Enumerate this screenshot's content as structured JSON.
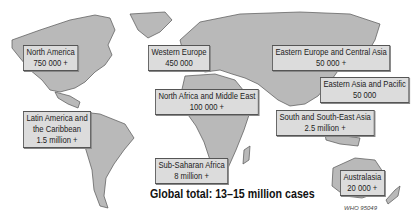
{
  "map": {
    "regions": [
      {
        "name": "North America",
        "value": "750 000 +"
      },
      {
        "name": "Western Europe",
        "value": "450 000"
      },
      {
        "name": "Eastern Europe and Central Asia",
        "value": "50 000 +"
      },
      {
        "name": "Eastern Asia and Pacific",
        "value": "50 000"
      },
      {
        "name": "North Africa and Middle East",
        "value": "100 000 +"
      },
      {
        "name": "Latin America and the Caribbean",
        "name_line1": "Latin America and",
        "name_line2": "the Caribbean",
        "value": "1.5 million +"
      },
      {
        "name": "South and South-East Asia",
        "value": "2.5 million +"
      },
      {
        "name": "Sub-Saharan Africa",
        "value": "8 million +"
      },
      {
        "name": "Australasia",
        "value": "20 000 +"
      }
    ],
    "total": "Global total: 13–15 million cases",
    "reference": "WHO 95049",
    "colors": {
      "land": "#b9b9b9",
      "box": "#dcdcdc",
      "border": "#555555"
    }
  }
}
